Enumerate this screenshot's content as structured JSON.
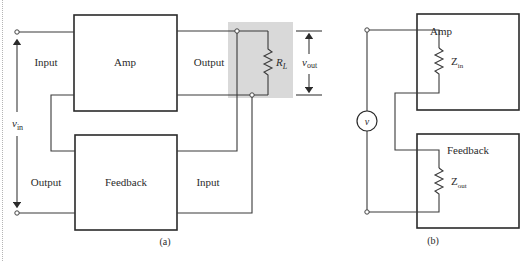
{
  "figure": {
    "a": {
      "caption": "(a)",
      "blocks": {
        "amp": "Amp",
        "feedback": "Feedback"
      },
      "labels": {
        "amp_input": "Input",
        "amp_output": "Output",
        "fb_output": "Output",
        "fb_input": "Input",
        "vin_main": "v",
        "vin_sub": "in",
        "vout_main": "v",
        "vout_sub": "out",
        "rl_main": "R",
        "rl_sub": "L"
      },
      "highlight_color": "#d9d9d9"
    },
    "b": {
      "caption": "(b)",
      "blocks": {
        "amp": "Amp",
        "feedback": "Feedback"
      },
      "labels": {
        "source": "v",
        "zin_main": "Z",
        "zin_sub": "in",
        "zout_main": "Z",
        "zout_sub": "out"
      }
    }
  }
}
